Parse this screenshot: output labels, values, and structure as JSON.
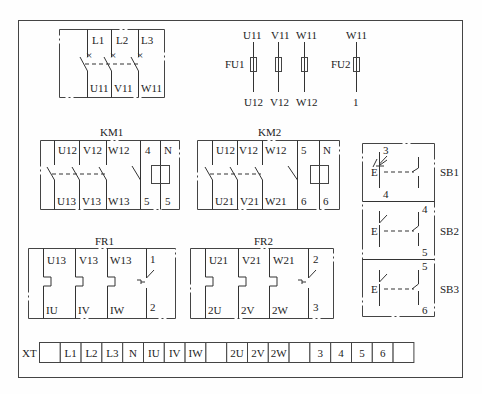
{
  "diagram": {
    "type": "electrical wiring layout",
    "components": {
      "qs": {
        "inputs": [
          "L1",
          "L2",
          "L3"
        ],
        "outputs": [
          "U11",
          "V11",
          "W11"
        ]
      },
      "fu1": {
        "label": "FU1",
        "top": [
          "U11",
          "V11",
          "W11"
        ],
        "bottom": [
          "U12",
          "V12",
          "W12"
        ]
      },
      "fu2": {
        "label": "FU2",
        "top": "W11",
        "bottom": "1"
      },
      "km1": {
        "label": "KM1",
        "top": [
          "U12",
          "V12",
          "W12",
          "4",
          "N"
        ],
        "bottom": [
          "U13",
          "V13",
          "W13",
          "5",
          "5"
        ]
      },
      "km2": {
        "label": "KM2",
        "top": [
          "U12",
          "V12",
          "W12",
          "5",
          "N"
        ],
        "bottom": [
          "U21",
          "V21",
          "W21",
          "6",
          "6"
        ]
      },
      "fr1": {
        "label": "FR1",
        "top": [
          "U13",
          "V13",
          "W13",
          "1"
        ],
        "bottom": [
          "IU",
          "IV",
          "IW",
          "2"
        ]
      },
      "fr2": {
        "label": "FR2",
        "top": [
          "U21",
          "V21",
          "W21",
          "2"
        ],
        "bottom": [
          "2U",
          "2V",
          "2W",
          "3"
        ]
      },
      "sb1": {
        "label": "SB1",
        "top": "3",
        "bottom": "4",
        "marker": "E"
      },
      "sb2": {
        "label": "SB2",
        "top": "4",
        "bottom": "5",
        "marker": "E"
      },
      "sb3": {
        "label": "SB3",
        "top": "5",
        "bottom": "6",
        "marker": "E"
      }
    },
    "terminal_strip": {
      "label": "XT",
      "cells": [
        "",
        "L1",
        "L2",
        "L3",
        "N",
        "IU",
        "IV",
        "IW",
        "",
        "2U",
        "2V",
        "2W",
        "",
        "3",
        "4",
        "5",
        "6",
        ""
      ]
    }
  }
}
